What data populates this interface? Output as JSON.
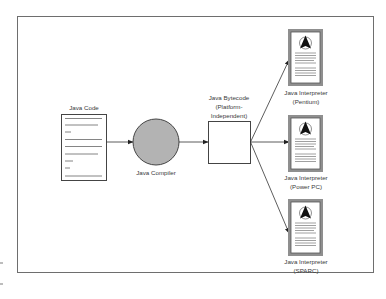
{
  "diagram": {
    "nodes": {
      "source": {
        "label": "Java Code",
        "shape": "document"
      },
      "compiler": {
        "label": "Java Compiler",
        "shape": "circle",
        "fill": "#b3b3b3"
      },
      "bytecode": {
        "label_lines": [
          "Java Bytecode",
          "(Platform-",
          "Independent)"
        ],
        "shape": "square"
      },
      "interpreters": [
        {
          "label_lines": [
            "Java Interpreter",
            "(Pentium)"
          ],
          "icon": "document-with-logo-icon"
        },
        {
          "label_lines": [
            "Java Interpreter",
            "(Power PC)"
          ],
          "icon": "document-with-logo-icon"
        },
        {
          "label_lines": [
            "Java Interpreter",
            "(SPARC)"
          ],
          "icon": "document-with-logo-icon"
        }
      ]
    },
    "edges": [
      {
        "from": "Java Code",
        "to": "Java Compiler"
      },
      {
        "from": "Java Compiler",
        "to": "Java Bytecode"
      },
      {
        "from": "Java Bytecode",
        "to": "Java Interpreter (Pentium)"
      },
      {
        "from": "Java Bytecode",
        "to": "Java Interpreter (Power PC)"
      },
      {
        "from": "Java Bytecode",
        "to": "Java Interpreter (SPARC)"
      }
    ],
    "colors": {
      "frame": "#6e6e6e",
      "stroke": "#333333",
      "compiler_fill": "#b3b3b3",
      "doc_border": "#555555",
      "doc_shadow": "#9a9a9a"
    }
  }
}
